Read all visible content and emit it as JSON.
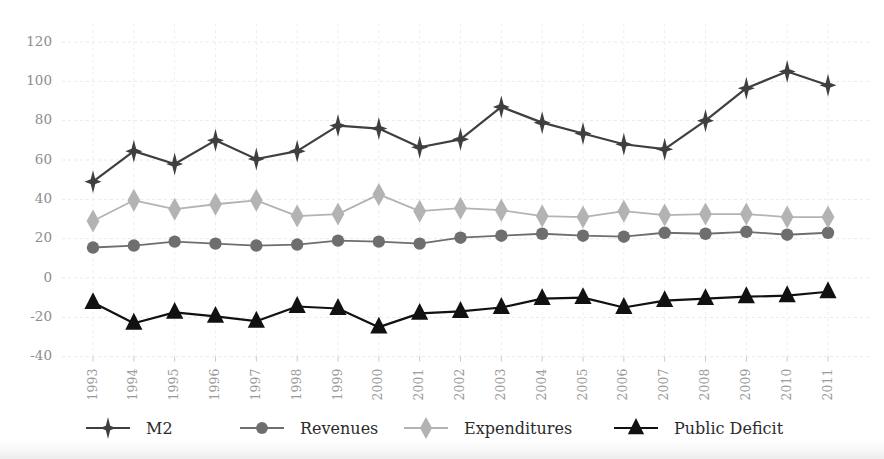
{
  "chart_data": {
    "type": "line",
    "title": "",
    "subtitle": "",
    "xlabel": "",
    "ylabel": "",
    "categories": [
      "1993",
      "1994",
      "1995",
      "1996",
      "1997",
      "1998",
      "1999",
      "2000",
      "2001",
      "2002",
      "2003",
      "2004",
      "2005",
      "2006",
      "2007",
      "2008",
      "2009",
      "2010",
      "2011"
    ],
    "x_tick_labels": [
      "1993",
      "1994",
      "1995",
      "1996",
      "1997",
      "1998",
      "1999",
      "2000",
      "2001",
      "2002",
      "2003",
      "2004",
      "2005",
      "2006",
      "2007",
      "2008",
      "2009",
      "2010",
      "2011"
    ],
    "x_tick_rotation": -90,
    "y_tick_labels": [
      "120",
      "100",
      "80",
      "60",
      "40",
      "20",
      "0",
      "-20",
      "-40"
    ],
    "y_ticks": [
      120,
      100,
      80,
      60,
      40,
      20,
      0,
      -20,
      -40
    ],
    "ylim": [
      -40,
      120
    ],
    "grid": true,
    "grid_axis": "both",
    "legend_position": "bottom",
    "series": [
      {
        "name": "M2",
        "marker": "star4",
        "color": "#3f3f3f",
        "values": [
          49,
          64.5,
          58,
          70,
          60.5,
          64.5,
          77.5,
          76,
          66.5,
          70.5,
          87,
          79,
          73.5,
          68,
          65.5,
          80,
          96.5,
          105,
          98
        ]
      },
      {
        "name": "Revenues",
        "marker": "circle",
        "color": "#6e6e6e",
        "values": [
          15.5,
          16.5,
          18.5,
          17.5,
          16.5,
          17,
          19,
          18.5,
          17.5,
          20.5,
          21.5,
          22.5,
          21.5,
          21,
          23,
          22.5,
          23.5,
          22,
          23
        ]
      },
      {
        "name": "Expenditures",
        "marker": "diamond",
        "color": "#b3b3b3",
        "values": [
          29,
          39.5,
          35,
          37.5,
          39.5,
          31.5,
          32.5,
          42.5,
          34,
          35.5,
          34.5,
          31.5,
          31,
          34,
          32,
          32.5,
          32.5,
          31,
          31
        ]
      },
      {
        "name": "Public Deficit",
        "marker": "triangle",
        "color": "#111111",
        "values": [
          -12.5,
          -23,
          -17.5,
          -19.5,
          -22,
          -14.5,
          -15.5,
          -25,
          -18,
          -17,
          -15,
          -10.5,
          -10,
          -15,
          -11.5,
          -10.5,
          -9.5,
          -9,
          -7
        ]
      }
    ]
  },
  "legend": {
    "items": [
      {
        "label": "M2",
        "marker": "star4-icon",
        "color": "#3f3f3f"
      },
      {
        "label": "Revenues",
        "marker": "circle-icon",
        "color": "#6e6e6e"
      },
      {
        "label": "Expenditures",
        "marker": "diamond-icon",
        "color": "#b3b3b3"
      },
      {
        "label": "Public Deficit",
        "marker": "triangle-icon",
        "color": "#111111"
      }
    ]
  },
  "colors": {
    "background": "#ffffff",
    "grid": "#e9e9ea",
    "tick_text": "#8d8d8d",
    "legend_text": "#2b2b2b",
    "m2": "#3f3f3f",
    "revenues": "#6e6e6e",
    "expenditures": "#b3b3b3",
    "public_deficit": "#111111"
  }
}
